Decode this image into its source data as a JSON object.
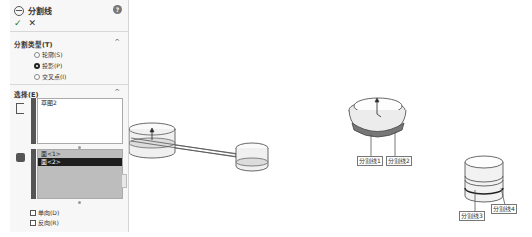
{
  "panel": {
    "title": "分割线",
    "help_icon": "?",
    "ok_icon": "✓",
    "cancel_icon": "✕",
    "split_type_section": {
      "title": "分割类型(T)",
      "options": [
        {
          "label": "轮廓(S)",
          "selected": false
        },
        {
          "label": "投影(P)",
          "selected": true
        },
        {
          "label": "交叉点(I)",
          "selected": false
        }
      ]
    },
    "selection_section": {
      "title": "选择(E)",
      "sketch_list": [
        "草图2"
      ],
      "face_list": [
        {
          "label": "面<1>",
          "selected": false
        },
        {
          "label": "面<2>",
          "selected": true
        }
      ],
      "checkboxes": [
        {
          "label": "单向(D)",
          "checked": false
        },
        {
          "label": "反向(R)",
          "checked": false
        }
      ]
    }
  },
  "viewport": {
    "callouts": [
      {
        "label": "分割线1"
      },
      {
        "label": "分割线2"
      },
      {
        "label": "分割线3"
      },
      {
        "label": "分割线4"
      }
    ]
  },
  "colors": {
    "panel_bg": "#f7f7f7",
    "selected_row": "#1e1e1e",
    "face_list_bg": "#bdbdbd",
    "ok_green": "#1a7a1a"
  }
}
